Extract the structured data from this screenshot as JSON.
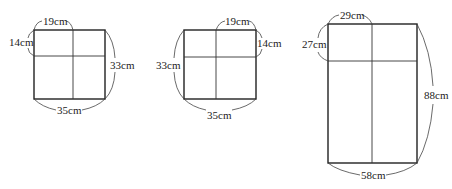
{
  "figures": [
    {
      "id": "figure-1",
      "labels": {
        "top_segment": "19cm",
        "left_segment": "14cm",
        "right_total": "33cm",
        "bottom_total": "35cm"
      }
    },
    {
      "id": "figure-2",
      "labels": {
        "top_segment": "19cm",
        "right_segment": "14cm",
        "left_total": "33cm",
        "bottom_total": "35cm"
      }
    },
    {
      "id": "figure-3",
      "labels": {
        "top_segment": "29cm",
        "left_segment": "27cm",
        "right_total": "88cm",
        "bottom_total": "58cm"
      }
    }
  ]
}
